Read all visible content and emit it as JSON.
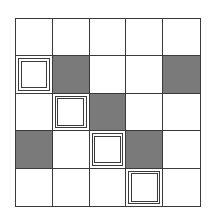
{
  "grid": {
    "rows": 5,
    "cols": 5,
    "colors": {
      "line": "#3a3a3a",
      "white": "#ffffff",
      "gray": "#7a7a7a"
    },
    "cells": [
      [
        "white",
        "white",
        "white",
        "white",
        "white"
      ],
      [
        "framed",
        "gray",
        "white",
        "white",
        "gray"
      ],
      [
        "white",
        "framed",
        "gray",
        "white",
        "white"
      ],
      [
        "gray",
        "white",
        "framed",
        "gray",
        "white"
      ],
      [
        "white",
        "white",
        "white",
        "framed",
        "white"
      ]
    ],
    "legend": {
      "white": "empty cell",
      "gray": "shaded cell",
      "framed": "double-framed square"
    }
  }
}
